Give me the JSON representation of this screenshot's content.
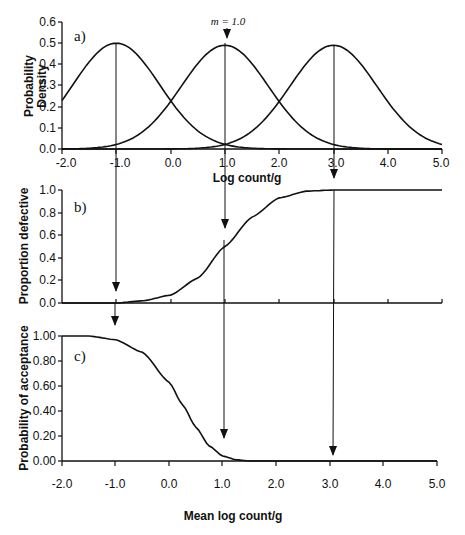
{
  "chart_data": [
    {
      "panel": "a)",
      "type": "line",
      "title": "",
      "xlabel": "Log count/g",
      "ylabel": "Probability Density",
      "xlim": [
        -2.0,
        5.0
      ],
      "ylim": [
        0.0,
        0.6
      ],
      "x_ticks": [
        "-2.0",
        "-1.0",
        "0.0",
        "1.0",
        "2.0",
        "3.0",
        "4.0",
        "5.0"
      ],
      "y_ticks": [
        "0.0",
        "0.1",
        "0.2",
        "0.3",
        "0.4",
        "0.5",
        "0.6"
      ],
      "grid": false,
      "annotation": "m = 1.0",
      "series": [
        {
          "name": "Normal density, mean -1.0",
          "mean": -1.0,
          "sd": 0.8,
          "peak": 0.5
        },
        {
          "name": "Normal density, mean 1.0",
          "mean": 1.0,
          "sd": 0.8,
          "peak": 0.49
        },
        {
          "name": "Normal density, mean 3.0",
          "mean": 3.0,
          "sd": 0.8,
          "peak": 0.49
        }
      ]
    },
    {
      "panel": "b)",
      "type": "line",
      "xlabel": "",
      "ylabel": "Proportion defective",
      "xlim": [
        -2.0,
        5.0
      ],
      "ylim": [
        0.0,
        1.0
      ],
      "y_ticks": [
        "0.0",
        "0.2",
        "0.4",
        "0.6",
        "0.8",
        "1.0"
      ],
      "grid": false,
      "x": [
        -2.0,
        -1.0,
        -0.5,
        0.0,
        0.5,
        1.0,
        1.5,
        2.0,
        2.5,
        3.0,
        4.0,
        5.0
      ],
      "values": [
        0.0,
        0.0,
        0.02,
        0.07,
        0.22,
        0.5,
        0.76,
        0.93,
        0.99,
        1.0,
        1.0,
        1.0
      ]
    },
    {
      "panel": "c)",
      "type": "line",
      "xlabel": "Mean log count/g",
      "ylabel": "Probability of acceptance",
      "xlim": [
        -2.0,
        5.0
      ],
      "ylim": [
        0.0,
        1.0
      ],
      "x_ticks": [
        "-2.0",
        "-1.0",
        "0.0",
        "1.0",
        "2.0",
        "3.0",
        "4.0",
        "5.0"
      ],
      "y_ticks": [
        "0.00",
        "0.20",
        "0.40",
        "0.60",
        "0.80",
        "1.00"
      ],
      "grid": false,
      "x": [
        -2.0,
        -1.5,
        -1.0,
        -0.5,
        0.0,
        0.25,
        0.5,
        0.75,
        1.0,
        1.25,
        1.5,
        2.0,
        3.0,
        5.0
      ],
      "values": [
        1.0,
        1.0,
        0.97,
        0.87,
        0.63,
        0.45,
        0.27,
        0.12,
        0.04,
        0.01,
        0.0,
        0.0,
        0.0,
        0.0
      ]
    }
  ],
  "labels": {
    "panel_a": "a)",
    "panel_b": "b)",
    "panel_c": "c)",
    "annotation_m": "m = 1.0",
    "a_ylabel_line1": "Probability",
    "a_ylabel_line2": "Density",
    "a_xlabel": "Log count/g",
    "b_ylabel": "Proportion defective",
    "c_ylabel": "Probability of acceptance",
    "c_xlabel": "Mean log count/g",
    "a_yticks": [
      "0.0",
      "0.1",
      "0.2",
      "0.3",
      "0.4",
      "0.5",
      "0.6"
    ],
    "b_yticks": [
      "0.0",
      "0.2",
      "0.4",
      "0.6",
      "0.8",
      "1.0"
    ],
    "c_yticks": [
      "0.00",
      "0.20",
      "0.40",
      "0.60",
      "0.80",
      "1.00"
    ],
    "xticks": [
      "-2.0",
      "-1.0",
      "0.0",
      "1.0",
      "2.0",
      "3.0",
      "4.0",
      "5.0"
    ]
  }
}
